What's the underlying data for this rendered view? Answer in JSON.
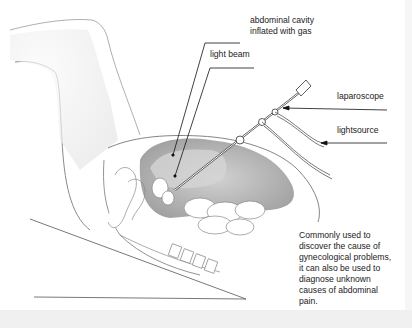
{
  "diagram": {
    "labels": {
      "abdominal_cavity": [
        "abdominal cavity",
        "inflated with gas"
      ],
      "light_beam": "light beam",
      "laparoscope": "laparoscope",
      "lightsource": "lightsource"
    },
    "note": [
      "Commonly used to",
      "discover the cause of",
      "gynecological problems,",
      "it can also be used to",
      "diagnose unknown",
      "causes of abdominal",
      "pain."
    ]
  },
  "colors": {
    "background": "#ffffff",
    "ink": "#222222",
    "shading": "#b9b9b9",
    "strip": "#f0f0f0"
  }
}
